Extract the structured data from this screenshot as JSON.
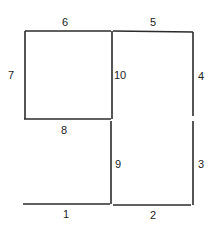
{
  "diagram": {
    "type": "numbered-line-segments",
    "segments": [
      {
        "id": "1",
        "label": "1",
        "x1": 23,
        "y1": 204,
        "x2": 110,
        "y2": 204,
        "lx": 63,
        "ly": 218
      },
      {
        "id": "2",
        "label": "2",
        "x1": 113,
        "y1": 205,
        "x2": 191,
        "y2": 205,
        "lx": 150,
        "ly": 219
      },
      {
        "id": "3",
        "label": "3",
        "x1": 193,
        "y1": 121,
        "x2": 193,
        "y2": 205,
        "lx": 198,
        "ly": 168
      },
      {
        "id": "4",
        "label": "4",
        "x1": 193,
        "y1": 32,
        "x2": 193,
        "y2": 116,
        "lx": 198,
        "ly": 80
      },
      {
        "id": "5",
        "label": "5",
        "x1": 113,
        "y1": 31,
        "x2": 193,
        "y2": 32,
        "lx": 150,
        "ly": 26
      },
      {
        "id": "6",
        "label": "6",
        "x1": 25,
        "y1": 31,
        "x2": 111,
        "y2": 31,
        "lx": 62,
        "ly": 26
      },
      {
        "id": "7",
        "label": "7",
        "x1": 25,
        "y1": 31,
        "x2": 25,
        "y2": 119,
        "lx": 8,
        "ly": 79
      },
      {
        "id": "8",
        "label": "8",
        "x1": 24,
        "y1": 119,
        "x2": 111,
        "y2": 119,
        "lx": 61,
        "ly": 134
      },
      {
        "id": "9",
        "label": "9",
        "x1": 111,
        "y1": 121,
        "x2": 111,
        "y2": 204,
        "lx": 115,
        "ly": 168
      },
      {
        "id": "10",
        "label": "10",
        "x1": 112,
        "y1": 31,
        "x2": 112,
        "y2": 119,
        "lx": 114,
        "ly": 79
      }
    ]
  }
}
